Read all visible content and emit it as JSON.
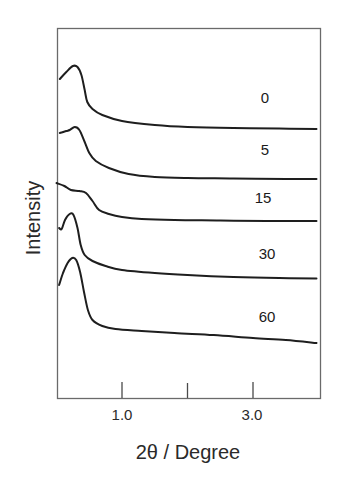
{
  "chart_data": {
    "type": "line",
    "title": "",
    "xlabel": "2θ / Degree",
    "ylabel": "Intensity",
    "xlim": [
      0,
      4.0
    ],
    "x_ticks": [
      1.0,
      2.0,
      3.0
    ],
    "x_tick_labels": [
      "1.0",
      "",
      "3.0"
    ],
    "y_ticks": [],
    "grid": false,
    "legend_position": "inline labels to the right of each curve",
    "stacked_offset": true,
    "series": [
      {
        "name": "0",
        "label_pos": [
          0.62,
          125
        ],
        "points": [
          [
            0.05,
            79
          ],
          [
            0.15,
            72
          ],
          [
            0.25,
            66
          ],
          [
            0.32,
            67
          ],
          [
            0.38,
            75
          ],
          [
            0.43,
            90
          ],
          [
            0.47,
            102
          ],
          [
            0.55,
            109
          ],
          [
            0.7,
            115
          ],
          [
            1.0,
            121
          ],
          [
            1.5,
            125
          ],
          [
            2.0,
            127
          ],
          [
            2.7,
            128
          ],
          [
            3.4,
            128.5
          ],
          [
            3.97,
            129
          ]
        ]
      },
      {
        "name": "5",
        "label_pos": [
          0.62,
          178
        ],
        "points": [
          [
            0.05,
            133
          ],
          [
            0.15,
            131
          ],
          [
            0.2,
            130
          ],
          [
            0.28,
            127
          ],
          [
            0.35,
            130
          ],
          [
            0.43,
            142
          ],
          [
            0.5,
            153
          ],
          [
            0.6,
            161
          ],
          [
            0.8,
            168
          ],
          [
            1.1,
            174
          ],
          [
            1.5,
            177
          ],
          [
            2.0,
            178
          ],
          [
            2.7,
            178.5
          ],
          [
            3.5,
            179
          ],
          [
            3.97,
            179
          ]
        ]
      },
      {
        "name": "15",
        "label_pos": [
          0.62,
          227
        ],
        "points": [
          [
            0.0,
            183
          ],
          [
            0.12,
            186
          ],
          [
            0.22,
            190
          ],
          [
            0.35,
            191
          ],
          [
            0.45,
            193
          ],
          [
            0.55,
            201
          ],
          [
            0.65,
            210
          ],
          [
            0.8,
            214
          ],
          [
            1.0,
            217
          ],
          [
            1.3,
            219
          ],
          [
            1.8,
            220
          ],
          [
            2.5,
            220.5
          ],
          [
            3.2,
            221
          ],
          [
            3.97,
            221
          ]
        ]
      },
      {
        "name": "30",
        "label_pos": [
          0.62,
          281
        ],
        "points": [
          [
            0.04,
            228
          ],
          [
            0.08,
            229
          ],
          [
            0.13,
            220
          ],
          [
            0.2,
            214
          ],
          [
            0.26,
            215
          ],
          [
            0.32,
            228
          ],
          [
            0.37,
            245
          ],
          [
            0.43,
            255
          ],
          [
            0.55,
            261
          ],
          [
            0.75,
            266
          ],
          [
            1.0,
            270
          ],
          [
            1.5,
            273
          ],
          [
            2.0,
            275
          ],
          [
            2.7,
            277
          ],
          [
            3.4,
            278
          ],
          [
            3.97,
            278.5
          ]
        ]
      },
      {
        "name": "60",
        "label_pos": [
          0.62,
          338
        ],
        "points": [
          [
            0.04,
            285
          ],
          [
            0.1,
            273
          ],
          [
            0.17,
            263
          ],
          [
            0.24,
            258
          ],
          [
            0.3,
            260
          ],
          [
            0.36,
            272
          ],
          [
            0.42,
            292
          ],
          [
            0.48,
            310
          ],
          [
            0.55,
            320
          ],
          [
            0.7,
            326
          ],
          [
            0.9,
            329
          ],
          [
            1.3,
            331
          ],
          [
            1.8,
            333
          ],
          [
            2.4,
            335
          ],
          [
            3.0,
            338
          ],
          [
            3.5,
            340
          ],
          [
            3.97,
            343
          ]
        ]
      }
    ]
  },
  "chart": {
    "xlabel": "2θ / Degree",
    "ylabel": "Intensity",
    "tick_labels": [
      "1.0",
      "3.0"
    ],
    "series_labels": [
      "0",
      "5",
      "15",
      "30",
      "60"
    ]
  }
}
